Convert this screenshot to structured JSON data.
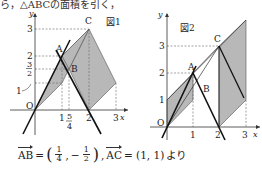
{
  "top_text": "ら，△ABCの面積を引く，",
  "figure1": {
    "label": "図1",
    "axis_x": "x",
    "axis_y": "y",
    "origin": "O",
    "x_ticks": [
      "1",
      "2",
      "3"
    ],
    "x_frac": {
      "num": "5",
      "den": "4"
    },
    "y_ticks": [
      "1",
      "2",
      "3"
    ],
    "y_frac": {
      "num": "3",
      "den": "2"
    },
    "points": {
      "A": "A",
      "B": "B",
      "C": "C"
    }
  },
  "figure2": {
    "label": "図2",
    "axis_x": "x",
    "axis_y": "y",
    "origin": "O",
    "x_ticks": [
      "1",
      "2",
      "3"
    ],
    "y_ticks": [
      "1",
      "2",
      "3"
    ],
    "points": {
      "A": "A",
      "B": "B",
      "C": "C"
    }
  },
  "formula": {
    "ab": "AB",
    "eq": "=",
    "ab_x": {
      "num": "1",
      "den": "4"
    },
    "minus": "−",
    "ab_y": {
      "num": "1",
      "den": "2"
    },
    "ac": "AC",
    "ac_val": "= (1, 1)",
    "suffix": "より"
  }
}
